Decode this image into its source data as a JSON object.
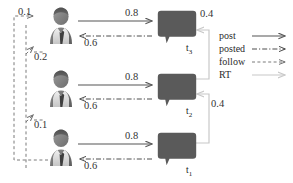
{
  "figure": {
    "type": "network-diagram",
    "background": "#ffffff",
    "colors": {
      "ink": "#2b2b2b",
      "avatar_dark": "#5a5a5a",
      "avatar_light": "#c9c9c9",
      "bubble_fill": "#5a5a5a",
      "post_arrow": "#555555",
      "posted_arrow": "#4d4d4d",
      "follow_arrow": "#7a7a7a",
      "rt_arrow": "#c8c8c8"
    }
  },
  "users": [
    {
      "id": "user-top",
      "name": "user-avatar-top"
    },
    {
      "id": "user-middle",
      "name": "user-avatar-middle"
    },
    {
      "id": "user-bottom",
      "name": "user-avatar-bottom"
    }
  ],
  "tweets": [
    {
      "id": "t3",
      "label": "t",
      "sub": "3"
    },
    {
      "id": "t2",
      "label": "t",
      "sub": "2"
    },
    {
      "id": "t1",
      "label": "t",
      "sub": "1"
    }
  ],
  "edge_weights": {
    "follow_top": "0.1",
    "follow_middle": "0.2",
    "follow_bottom": "0.1",
    "post_top": "0.8",
    "post_middle": "0.8",
    "post_bottom": "0.8",
    "posted_top": "0.6",
    "posted_middle": "0.6",
    "posted_bottom": "0.6",
    "rt_upper": "0.4",
    "rt_lower": "0.4"
  },
  "legend": {
    "items": [
      {
        "label": "post",
        "style": "solid",
        "color": "#555555"
      },
      {
        "label": "posted",
        "style": "dash-dot",
        "color": "#4d4d4d"
      },
      {
        "label": "follow",
        "style": "dashed",
        "color": "#7a7a7a"
      },
      {
        "label": "RT",
        "style": "solid-light",
        "color": "#c8c8c8"
      }
    ]
  }
}
